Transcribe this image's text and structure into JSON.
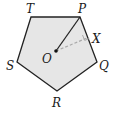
{
  "figure": {
    "type": "regular-pentagon",
    "colors": {
      "fill": "#e6e6e6",
      "stroke": "#222222",
      "dashed": "#aaaaaa"
    },
    "vertices": [
      {
        "name": "P",
        "label": "P"
      },
      {
        "name": "Q",
        "label": "Q"
      },
      {
        "name": "R",
        "label": "R"
      },
      {
        "name": "S",
        "label": "S"
      },
      {
        "name": "T",
        "label": "T"
      }
    ],
    "center": {
      "label": "O"
    },
    "foot_point": {
      "label": "X"
    },
    "segments": [
      {
        "from": "O",
        "to": "P",
        "style": "solid",
        "description": "radius"
      },
      {
        "from": "O",
        "to": "X",
        "style": "dashed",
        "description": "apothem"
      }
    ],
    "right_angle_marker": "X"
  }
}
